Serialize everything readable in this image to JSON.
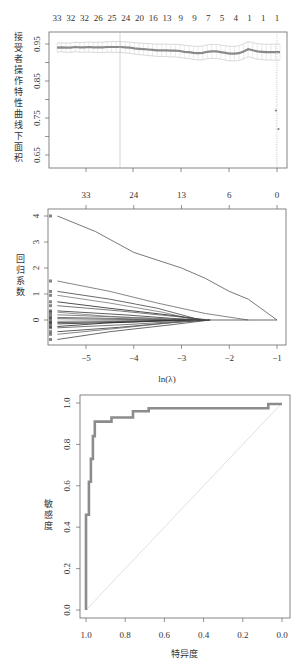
{
  "chart_data": [
    {
      "type": "scatter",
      "title": "",
      "xlabel": "",
      "ylabel": "接受者操作特性曲线下面积",
      "ylabel_chars": [
        "接",
        "受",
        "者",
        "操",
        "作",
        "特",
        "性",
        "曲",
        "线",
        "下",
        "面",
        "积"
      ],
      "yticks": [
        "0.95",
        "0.85",
        "0.75",
        "0.65"
      ],
      "ylim": [
        0.62,
        0.98
      ],
      "top_axis_labels": [
        "33",
        "32",
        "32",
        "26",
        "25",
        "24",
        "20",
        "16",
        "13",
        "9",
        "9",
        "7",
        "5",
        "4",
        "1",
        "1",
        "1"
      ],
      "vlines_x_px": [
        120,
        277
      ],
      "series": [
        {
          "name": "cv AUC mean",
          "x": [
            0,
            1,
            2,
            3,
            4,
            5,
            6,
            7,
            8,
            9,
            10,
            11,
            12,
            13,
            14,
            15,
            16,
            17,
            18,
            19,
            20,
            21,
            22,
            23,
            24,
            25,
            26,
            27,
            28,
            29,
            30,
            31,
            32,
            33,
            34,
            35,
            36,
            37,
            38,
            39,
            40,
            41,
            42,
            43,
            44,
            45,
            46,
            47,
            48,
            49
          ],
          "values": [
            0.94,
            0.941,
            0.94,
            0.94,
            0.942,
            0.941,
            0.941,
            0.942,
            0.941,
            0.941,
            0.941,
            0.942,
            0.942,
            0.942,
            0.942,
            0.941,
            0.94,
            0.938,
            0.937,
            0.936,
            0.935,
            0.934,
            0.933,
            0.933,
            0.933,
            0.932,
            0.932,
            0.931,
            0.929,
            0.928,
            0.926,
            0.925,
            0.926,
            0.929,
            0.93,
            0.93,
            0.928,
            0.926,
            0.924,
            0.924,
            0.925,
            0.93,
            0.936,
            0.933,
            0.93,
            0.929,
            0.928,
            0.928,
            0.928,
            0.928
          ]
        },
        {
          "name": "outliers",
          "values": [
            0.77,
            0.72
          ]
        }
      ]
    },
    {
      "type": "line",
      "title": "",
      "xlabel": "ln(λ)",
      "ylabel": "回归系数",
      "ylabel_chars": [
        "回",
        "归",
        "系",
        "数"
      ],
      "xticks": [
        "-5",
        "-4",
        "-3",
        "-2",
        "-1"
      ],
      "yticks": [
        "0",
        "1",
        "2",
        "3",
        "4"
      ],
      "xlim": [
        -5.8,
        -0.8
      ],
      "ylim": [
        -0.9,
        4.3
      ],
      "top_axis_labels": [
        "33",
        "24",
        "13",
        "6",
        "0"
      ],
      "series": [
        {
          "name": "coef_1",
          "x": [
            -5.6,
            -4.8,
            -4.0,
            -3.5,
            -3.0,
            -2.5,
            -2.0,
            -1.6,
            -1.0
          ],
          "values": [
            4.0,
            3.4,
            2.6,
            2.3,
            2.0,
            1.6,
            1.1,
            0.8,
            0.0
          ]
        },
        {
          "name": "coef_2",
          "x": [
            -5.6,
            -4.5,
            -3.5,
            -2.5,
            -1.6
          ],
          "values": [
            1.5,
            1.1,
            0.65,
            0.25,
            0.0
          ]
        },
        {
          "name": "coef_3",
          "x": [
            -5.6,
            -4.5,
            -3.5,
            -2.6
          ],
          "values": [
            1.1,
            0.8,
            0.45,
            0.0
          ]
        },
        {
          "name": "coef_4",
          "x": [
            -5.6,
            -4.5,
            -3.4,
            -2.7
          ],
          "values": [
            0.95,
            0.65,
            0.3,
            0.0
          ]
        },
        {
          "name": "coef_5",
          "x": [
            -5.6,
            -4.5,
            -3.3,
            -2.5
          ],
          "values": [
            0.7,
            0.45,
            0.2,
            0.0
          ]
        },
        {
          "name": "coef_6",
          "x": [
            -5.6,
            -4.3,
            -3.2,
            -2.4
          ],
          "values": [
            0.55,
            0.35,
            0.15,
            0.0
          ]
        },
        {
          "name": "coef_7",
          "x": [
            -5.6,
            -4.2,
            -3.1,
            -2.6
          ],
          "values": [
            0.35,
            0.2,
            0.05,
            0.0
          ]
        },
        {
          "name": "coef_8",
          "x": [
            -5.6,
            -4.1,
            -3.0,
            -2.7
          ],
          "values": [
            0.2,
            0.1,
            0.03,
            0.0
          ]
        },
        {
          "name": "coef_9",
          "x": [
            -5.6,
            -4.0,
            -3.3
          ],
          "values": [
            0.05,
            0.02,
            0.0
          ]
        },
        {
          "name": "coef_10",
          "x": [
            -5.6,
            -4.0,
            -3.2
          ],
          "values": [
            -0.05,
            -0.02,
            0.0
          ]
        },
        {
          "name": "coef_11",
          "x": [
            -5.6,
            -4.1,
            -3.0,
            -2.6
          ],
          "values": [
            -0.15,
            -0.08,
            -0.02,
            0.0
          ]
        },
        {
          "name": "coef_12",
          "x": [
            -5.6,
            -4.2,
            -3.1,
            -2.5
          ],
          "values": [
            -0.3,
            -0.18,
            -0.06,
            0.0
          ]
        },
        {
          "name": "coef_13",
          "x": [
            -5.6,
            -4.3,
            -3.2,
            -2.4
          ],
          "values": [
            -0.45,
            -0.28,
            -0.1,
            0.0
          ]
        },
        {
          "name": "coef_14",
          "x": [
            -5.6,
            -4.5,
            -3.3,
            -2.6
          ],
          "values": [
            -0.55,
            -0.35,
            -0.12,
            0.0
          ]
        },
        {
          "name": "coef_15",
          "x": [
            -5.6,
            -4.5,
            -3.2,
            -2.4
          ],
          "values": [
            -0.75,
            -0.45,
            -0.18,
            0.0
          ]
        },
        {
          "name": "coef_16",
          "x": [
            -5.6,
            -4.6,
            -3.6,
            -2.8
          ],
          "values": [
            0.3,
            0.15,
            0.05,
            0.0
          ]
        },
        {
          "name": "coef_17",
          "x": [
            -5.6,
            -4.6,
            -3.6,
            -2.9
          ],
          "values": [
            -0.25,
            -0.12,
            -0.04,
            0.0
          ]
        },
        {
          "name": "coef_18",
          "x": [
            -5.6,
            -4.4,
            -3.4,
            -2.8
          ],
          "values": [
            0.1,
            0.06,
            0.02,
            0.0
          ]
        },
        {
          "name": "coef_19",
          "x": [
            -5.6,
            -4.4,
            -3.4,
            -2.8
          ],
          "values": [
            -0.1,
            -0.06,
            -0.02,
            0.0
          ]
        }
      ]
    },
    {
      "type": "line",
      "title": "",
      "xlabel": "特异度",
      "ylabel": "敏感度",
      "ylabel_chars": [
        "敏",
        "感",
        "度"
      ],
      "xticks": [
        "1.0",
        "0.8",
        "0.6",
        "0.4",
        "0.2",
        "0.0"
      ],
      "yticks": [
        "0.0",
        "0.2",
        "0.4",
        "0.6",
        "0.8",
        "1.0"
      ],
      "xlim": [
        1.03,
        -0.04
      ],
      "ylim": [
        -0.04,
        1.04
      ],
      "x_reversed": true,
      "series": [
        {
          "name": "ROC",
          "specificity": [
            1.0,
            1.0,
            0.985,
            0.985,
            0.975,
            0.975,
            0.965,
            0.965,
            0.955,
            0.955,
            0.945,
            0.945,
            0.87,
            0.87,
            0.76,
            0.76,
            0.68,
            0.68,
            0.07,
            0.07,
            0.0
          ],
          "sensitivity": [
            0.0,
            0.46,
            0.46,
            0.62,
            0.62,
            0.73,
            0.73,
            0.84,
            0.84,
            0.91,
            0.91,
            0.91,
            0.91,
            0.93,
            0.93,
            0.96,
            0.96,
            0.975,
            0.975,
            0.995,
            0.995
          ]
        },
        {
          "name": "reference",
          "specificity": [
            1.0,
            0.0
          ],
          "sensitivity": [
            0.0,
            1.0
          ]
        }
      ]
    }
  ],
  "colors": {
    "frame": "#666666",
    "roc_line": "#8c8c8c",
    "diag_line": "#d8d8d8",
    "auc_line": "#8a8a8a",
    "auc_band": "#c8c8c8",
    "coef_line": "#444444"
  }
}
